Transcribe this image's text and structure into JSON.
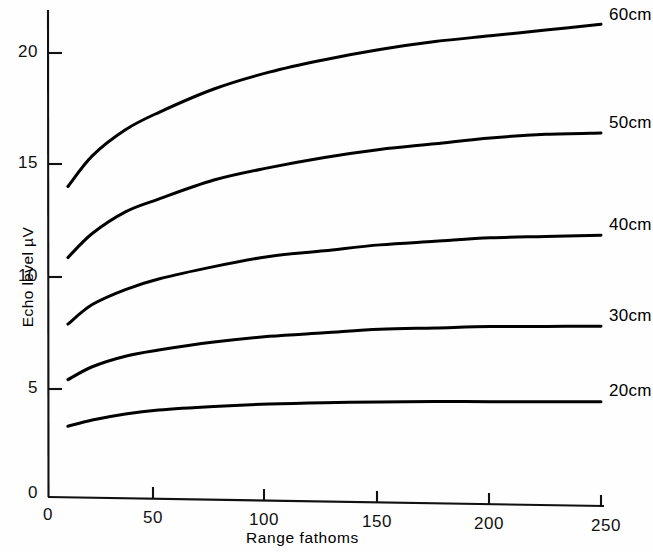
{
  "chart_data": {
    "type": "line",
    "title": "",
    "xlabel": "Range fathoms",
    "ylabel": "Echo level µV",
    "xlim": [
      0,
      250
    ],
    "ylim": [
      0,
      22.3
    ],
    "grid": false,
    "legend_position": "right-of-curve-ends",
    "x_ticks": [
      {
        "value": 0,
        "label": "0"
      },
      {
        "value": 50,
        "label": "50"
      },
      {
        "value": 100,
        "label": "100"
      },
      {
        "value": 150,
        "label": "150"
      },
      {
        "value": 200,
        "label": "200"
      },
      {
        "value": 250,
        "label": "250"
      }
    ],
    "y_ticks": [
      {
        "value": 0,
        "label": "0"
      },
      {
        "value": 5,
        "label": "5"
      },
      {
        "value": 10,
        "label": "10"
      },
      {
        "value": 15,
        "label": "15"
      },
      {
        "value": 20,
        "label": "20"
      }
    ],
    "x": [
      9,
      20,
      35,
      50,
      75,
      100,
      125,
      150,
      175,
      200,
      225,
      250
    ],
    "series": [
      {
        "name": "60cm",
        "label": "60cm",
        "color": "#000000",
        "values": [
          14.0,
          15.4,
          16.6,
          17.4,
          18.5,
          19.3,
          19.9,
          20.4,
          20.8,
          21.1,
          21.4,
          21.7
        ]
      },
      {
        "name": "50cm",
        "label": "50cm",
        "color": "#000000",
        "values": [
          10.8,
          11.9,
          12.9,
          13.5,
          14.4,
          15.0,
          15.5,
          15.9,
          16.2,
          16.5,
          16.7,
          16.8
        ]
      },
      {
        "name": "40cm",
        "label": "40cm",
        "color": "#000000",
        "values": [
          7.8,
          8.7,
          9.4,
          9.9,
          10.5,
          11.0,
          11.3,
          11.6,
          11.8,
          12.0,
          12.1,
          12.2
        ]
      },
      {
        "name": "30cm",
        "label": "30cm",
        "color": "#000000",
        "values": [
          5.3,
          5.9,
          6.4,
          6.7,
          7.1,
          7.4,
          7.6,
          7.8,
          7.9,
          8.0,
          8.05,
          8.1
        ]
      },
      {
        "name": "20cm",
        "label": "20cm",
        "color": "#000000",
        "values": [
          3.2,
          3.5,
          3.8,
          4.0,
          4.2,
          4.35,
          4.45,
          4.52,
          4.58,
          4.62,
          4.66,
          4.7
        ]
      }
    ]
  },
  "axis_marks": {
    "origin_y_symbol": "0",
    "origin_x_symbol": "0"
  }
}
